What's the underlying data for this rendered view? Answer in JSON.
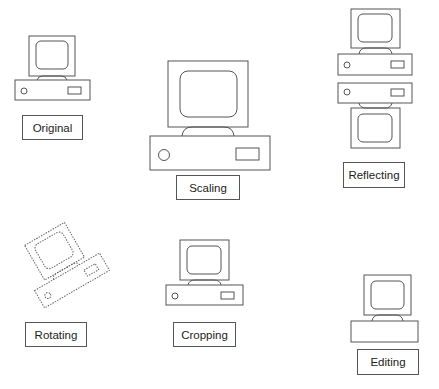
{
  "diagram": {
    "panels": [
      {
        "id": "original",
        "label": "Original"
      },
      {
        "id": "scaling",
        "label": "Scaling"
      },
      {
        "id": "reflecting",
        "label": "Reflecting"
      },
      {
        "id": "rotating",
        "label": "Rotating"
      },
      {
        "id": "cropping",
        "label": "Cropping"
      },
      {
        "id": "editing",
        "label": "Editing"
      }
    ],
    "colors": {
      "stroke": "#555555",
      "background": "#ffffff"
    }
  }
}
